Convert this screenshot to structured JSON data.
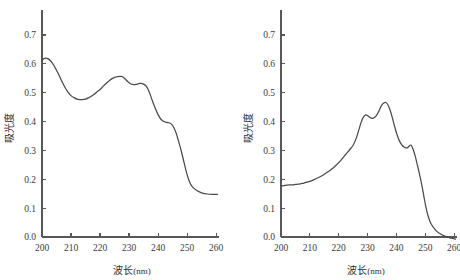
{
  "figure": {
    "background": "#ffffff",
    "line_color": "#4a4a4c",
    "axis_color": "#58585a",
    "panel_count": 2
  },
  "chart_data": [
    {
      "type": "line",
      "panel": "left",
      "title": "",
      "subtitle": "",
      "xlabel": "波长(nm)",
      "ylabel": "吸光度",
      "xlabel_text": "波长",
      "xlabel_unit": "(nm)",
      "xlim": [
        200,
        261
      ],
      "ylim": [
        0.0,
        0.755
      ],
      "xticks": [
        200,
        210,
        220,
        230,
        240,
        250,
        260
      ],
      "xticklabels": [
        "200",
        "210",
        "220",
        "230",
        "240",
        "250",
        "260"
      ],
      "yticks": [
        0.0,
        0.1,
        0.2,
        0.3,
        0.4,
        0.5,
        0.6,
        0.7
      ],
      "yticklabels": [
        "0.0",
        "0.1",
        "0.2",
        "0.3",
        "0.4",
        "0.5",
        "0.6",
        "0.7"
      ],
      "grid": false,
      "legend": null,
      "series": [
        {
          "name": "absorbance",
          "x": [
            200.0,
            200.6,
            201.3,
            202.0,
            203.0,
            204.0,
            205.0,
            206.0,
            207.0,
            208.0,
            209.0,
            210.0,
            211.0,
            212.0,
            213.0,
            214.0,
            215.0,
            216.0,
            217.0,
            218.0,
            219.0,
            220.0,
            221.0,
            222.0,
            223.0,
            224.0,
            225.0,
            226.0,
            227.0,
            227.6,
            228.5,
            229.5,
            230.5,
            231.5,
            232.5,
            233.2,
            234.0,
            235.0,
            235.8,
            236.5,
            237.2,
            238.0,
            239.0,
            240.0,
            241.0,
            242.0,
            243.0,
            243.8,
            244.6,
            245.5,
            246.3,
            247.0,
            248.0,
            249.0,
            250.0,
            251.0,
            252.0,
            253.5,
            255.0,
            257.0,
            259.0,
            260.5
          ],
          "y": [
            0.612,
            0.618,
            0.62,
            0.618,
            0.61,
            0.596,
            0.578,
            0.558,
            0.536,
            0.517,
            0.501,
            0.49,
            0.483,
            0.478,
            0.476,
            0.476,
            0.478,
            0.482,
            0.488,
            0.495,
            0.503,
            0.511,
            0.521,
            0.531,
            0.54,
            0.548,
            0.553,
            0.556,
            0.557,
            0.556,
            0.549,
            0.539,
            0.531,
            0.528,
            0.529,
            0.531,
            0.532,
            0.53,
            0.524,
            0.513,
            0.496,
            0.473,
            0.447,
            0.424,
            0.408,
            0.4,
            0.397,
            0.396,
            0.391,
            0.378,
            0.358,
            0.334,
            0.298,
            0.256,
            0.216,
            0.187,
            0.172,
            0.16,
            0.153,
            0.149,
            0.148,
            0.148
          ]
        }
      ],
      "features": {
        "start_value": 0.612,
        "initial_peak": {
          "x": 201.3,
          "y": 0.62
        },
        "trough": {
          "x": 213.5,
          "y": 0.476
        },
        "main_peak": {
          "x": 227.2,
          "y": 0.557
        },
        "shoulder_dip": {
          "x": 231.5,
          "y": 0.528
        },
        "second_peak": {
          "x": 234.2,
          "y": 0.532
        },
        "plateau": {
          "x": 243.5,
          "y": 0.397
        },
        "tail_value": 0.148
      }
    },
    {
      "type": "line",
      "panel": "right",
      "title": "",
      "subtitle": "",
      "xlabel": "波长(nm)",
      "ylabel": "吸光度",
      "xlabel_text": "波长",
      "xlabel_unit": "(nm)",
      "xlim": [
        200,
        261
      ],
      "ylim": [
        0.0,
        0.755
      ],
      "xticks": [
        200,
        210,
        220,
        230,
        240,
        250,
        260
      ],
      "xticklabels": [
        "200",
        "210",
        "220",
        "230",
        "240",
        "250",
        "260"
      ],
      "yticks": [
        0.0,
        0.1,
        0.2,
        0.3,
        0.4,
        0.5,
        0.6,
        0.7
      ],
      "yticklabels": [
        "0.0",
        "0.1",
        "0.2",
        "0.3",
        "0.4",
        "0.5",
        "0.6",
        "0.7"
      ],
      "grid": false,
      "legend": null,
      "series": [
        {
          "name": "absorbance",
          "x": [
            200.0,
            201.0,
            202.0,
            203.0,
            204.0,
            205.0,
            206.0,
            207.0,
            208.0,
            209.0,
            210.0,
            211.5,
            213.0,
            214.5,
            216.0,
            217.5,
            219.0,
            220.5,
            222.0,
            223.0,
            224.0,
            225.0,
            226.0,
            227.0,
            227.8,
            228.6,
            229.4,
            230.2,
            231.0,
            232.0,
            233.0,
            234.0,
            234.8,
            235.6,
            236.3,
            237.0,
            237.8,
            238.6,
            239.4,
            240.2,
            241.0,
            241.8,
            242.6,
            243.2,
            243.8,
            244.3,
            244.8,
            245.2,
            245.8,
            246.5,
            247.2,
            248.0,
            248.8,
            249.5,
            250.2,
            251.0,
            252.0,
            253.5,
            255.0,
            257.0,
            259.0,
            260.5
          ],
          "y": [
            0.176,
            0.178,
            0.18,
            0.181,
            0.181,
            0.182,
            0.183,
            0.185,
            0.187,
            0.19,
            0.193,
            0.199,
            0.206,
            0.214,
            0.224,
            0.235,
            0.248,
            0.263,
            0.281,
            0.293,
            0.305,
            0.318,
            0.34,
            0.372,
            0.398,
            0.416,
            0.423,
            0.419,
            0.413,
            0.412,
            0.42,
            0.438,
            0.455,
            0.464,
            0.466,
            0.459,
            0.44,
            0.413,
            0.382,
            0.355,
            0.334,
            0.32,
            0.312,
            0.309,
            0.309,
            0.314,
            0.318,
            0.317,
            0.303,
            0.281,
            0.252,
            0.218,
            0.18,
            0.142,
            0.105,
            0.072,
            0.046,
            0.025,
            0.012,
            0.002,
            -0.004,
            -0.007
          ]
        }
      ],
      "features": {
        "start_value": 0.176,
        "baseline_plateau": {
          "x": 204.0,
          "y": 0.181
        },
        "first_peak": {
          "x": 228.8,
          "y": 0.423
        },
        "dip": {
          "x": 231.6,
          "y": 0.412
        },
        "main_peak": {
          "x": 236.0,
          "y": 0.466
        },
        "shoulder": {
          "x": 244.8,
          "y": 0.318
        },
        "tail_value": -0.007
      }
    }
  ]
}
